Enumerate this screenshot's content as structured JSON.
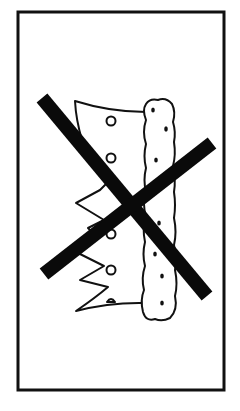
{
  "sign": {
    "title": "No crown",
    "symbol": "crown-icon",
    "overlay": "prohibition-x",
    "colors": {
      "background": "#ffffff",
      "stroke": "#111111",
      "x_mark": "#0a0a0a"
    }
  }
}
